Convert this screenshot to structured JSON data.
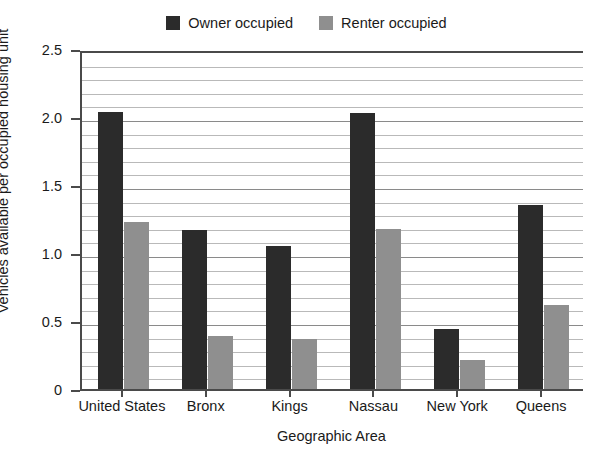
{
  "chart_data": {
    "type": "bar",
    "title": "",
    "subtitle": "",
    "xlabel": "Geographic Area",
    "ylabel": "Vehicles available per occupied housing unit",
    "categories": [
      "United States",
      "Bronx",
      "Kings",
      "Nassau",
      "New York",
      "Queens"
    ],
    "series": [
      {
        "name": "Owner occupied",
        "color": "#2b2b2b",
        "values": [
          2.04,
          1.17,
          1.05,
          2.03,
          0.44,
          1.35
        ]
      },
      {
        "name": "Renter occupied",
        "color": "#8f8f8f",
        "values": [
          1.23,
          0.39,
          0.37,
          1.18,
          0.21,
          0.62
        ]
      }
    ],
    "ylim": [
      0,
      2.5
    ],
    "y_major_ticks": [
      0,
      0.5,
      1.0,
      1.5,
      2.0,
      2.5
    ],
    "y_major_tick_labels": [
      "0",
      "0.5",
      "1.0",
      "1.5",
      "2.0",
      "2.5"
    ],
    "y_minor_tick_step": 0.1,
    "grid": true,
    "grid_axis": "y",
    "legend_position": "top-center",
    "axis_color": "#4a4a4a",
    "gridline_color": "#b9b9b9",
    "background_color": "#ffffff"
  },
  "legend": {
    "entries": [
      {
        "label": "Owner occupied",
        "swatch_name": "legend-swatch-owner-occupied"
      },
      {
        "label": "Renter occupied",
        "swatch_name": "legend-swatch-renter-occupied"
      }
    ]
  }
}
